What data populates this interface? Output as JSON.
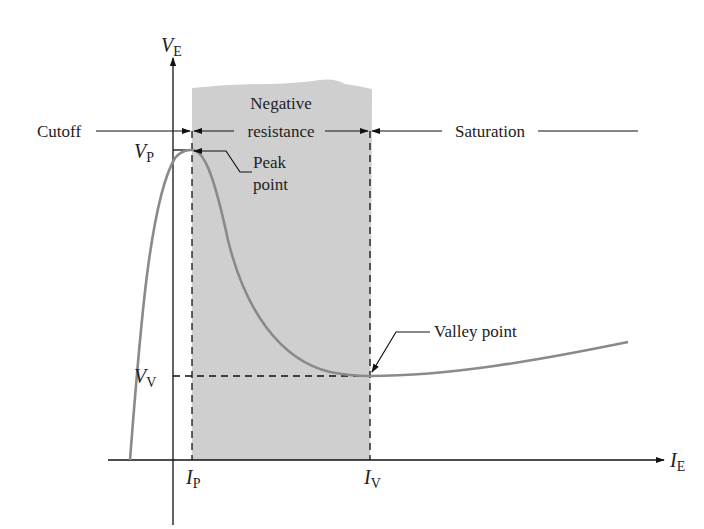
{
  "diagram": {
    "axes": {
      "y_label_main": "V",
      "y_label_sub": "E",
      "x_label_main": "I",
      "x_label_sub": "E"
    },
    "regions": {
      "cutoff": "Cutoff",
      "negative_resistance_line1": "Negative",
      "negative_resistance_line2": "resistance",
      "saturation": "Saturation"
    },
    "points": {
      "peak_line1": "Peak",
      "peak_line2": "point",
      "valley": "Valley point"
    },
    "ticks": {
      "vp_main": "V",
      "vp_sub": "P",
      "vv_main": "V",
      "vv_sub": "V",
      "ip_main": "I",
      "ip_sub": "P",
      "iv_main": "I",
      "iv_sub": "V"
    },
    "colors": {
      "curve": "#8a8a8a",
      "shade": "#cfcfcf",
      "lines": "#111111"
    }
  }
}
